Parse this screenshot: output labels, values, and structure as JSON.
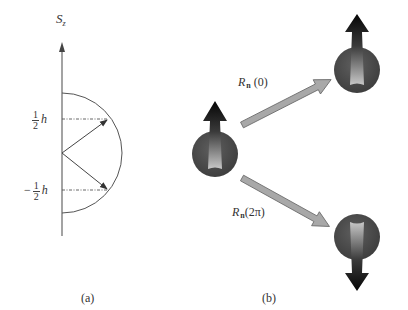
{
  "panel_a": {
    "axis_label_main": "S",
    "axis_label_sub": "z",
    "upper_level": {
      "sign": "",
      "num": "1",
      "den": "2",
      "symbol": "h"
    },
    "lower_level": {
      "sign": "−",
      "num": "1",
      "den": "2",
      "symbol": "h"
    },
    "caption": "(a)"
  },
  "panel_b": {
    "rotation_top": {
      "op": "R",
      "sub": "n",
      "arg": "(0)"
    },
    "rotation_bottom": {
      "op": "R",
      "sub": "n",
      "arg": "(2π)"
    },
    "caption": "(b)"
  },
  "colors": {
    "line": "#555555",
    "sphere": "#4a4a4a",
    "arrow_dark": "#111111",
    "arrow_light": "#bdbdbd",
    "transition_arrow": "#a8a8a8"
  }
}
